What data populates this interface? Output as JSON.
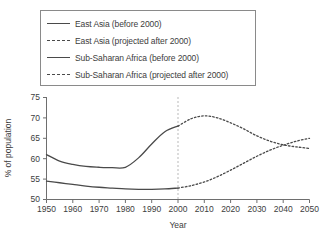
{
  "legend": {
    "items": [
      {
        "label": "East Asia (before 2000)",
        "style": "solid"
      },
      {
        "label": "East Asia (projected after 2000)",
        "style": "dashed"
      },
      {
        "label": "Sub-Saharan Africa (before 2000)",
        "style": "solid"
      },
      {
        "label": "Sub-Saharan Africa (projected after 2000)",
        "style": "dashed"
      }
    ]
  },
  "axes": {
    "xlabel": "Year",
    "ylabel": "% of population",
    "xticks": [
      "1950",
      "1960",
      "1970",
      "1980",
      "1990",
      "2000",
      "2010",
      "2020",
      "2030",
      "2040",
      "2050"
    ],
    "yticks": [
      "50",
      "55",
      "60",
      "65",
      "70",
      "75"
    ]
  },
  "chart_data": {
    "type": "line",
    "title": "",
    "xlabel": "Year",
    "ylabel": "% of population",
    "xlim": [
      1950,
      2050
    ],
    "ylim": [
      50,
      75
    ],
    "grid": false,
    "legend_position": "top",
    "annotations": [
      {
        "type": "vline",
        "x": 2000,
        "style": "dashed",
        "note": "boundary between historical data and projection"
      }
    ],
    "series": [
      {
        "name": "East Asia (before 2000)",
        "style": "solid",
        "x": [
          1950,
          1955,
          1960,
          1965,
          1970,
          1975,
          1980,
          1985,
          1990,
          1995,
          2000
        ],
        "values": [
          61.0,
          59.4,
          58.6,
          58.1,
          57.9,
          57.8,
          57.9,
          60.2,
          63.6,
          66.6,
          68.0
        ]
      },
      {
        "name": "East Asia (projected after 2000)",
        "style": "dashed",
        "x": [
          2000,
          2005,
          2010,
          2015,
          2020,
          2025,
          2030,
          2035,
          2040,
          2045,
          2050
        ],
        "values": [
          68.0,
          69.8,
          70.5,
          70.0,
          68.8,
          67.3,
          65.6,
          64.3,
          63.4,
          62.9,
          62.5
        ]
      },
      {
        "name": "Sub-Saharan Africa (before 2000)",
        "style": "solid",
        "x": [
          1950,
          1955,
          1960,
          1965,
          1970,
          1975,
          1980,
          1985,
          1990,
          1995,
          2000
        ],
        "values": [
          54.5,
          54.1,
          53.7,
          53.3,
          53.0,
          52.8,
          52.6,
          52.5,
          52.5,
          52.6,
          52.8
        ]
      },
      {
        "name": "Sub-Saharan Africa (projected after 2000)",
        "style": "dashed",
        "x": [
          2000,
          2005,
          2010,
          2015,
          2020,
          2025,
          2030,
          2035,
          2040,
          2045,
          2050
        ],
        "values": [
          52.8,
          53.4,
          54.3,
          55.6,
          57.2,
          58.9,
          60.6,
          62.1,
          63.3,
          64.3,
          65.0
        ]
      }
    ]
  }
}
